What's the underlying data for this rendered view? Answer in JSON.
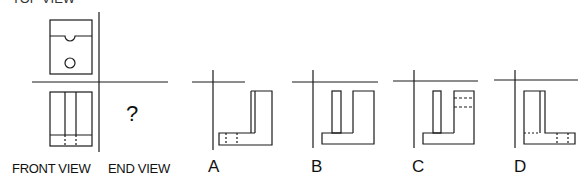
{
  "labels": {
    "top_view": "TOP VIEW",
    "front_view": "FRONT VIEW",
    "end_view": "END VIEW",
    "unknown": "?"
  },
  "options": [
    {
      "letter": "A"
    },
    {
      "letter": "B"
    },
    {
      "letter": "C"
    },
    {
      "letter": "D"
    }
  ],
  "colors": {
    "line": "#1a1a1a",
    "background": "#ffffff"
  }
}
